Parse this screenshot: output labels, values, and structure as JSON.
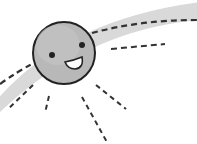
{
  "illustration": {
    "subject": "smiling sun on arc path with dashed rays",
    "colors": {
      "background": "#ffffff",
      "arc_band": "#d9d9d9",
      "sun_fill": "#b8b8b8",
      "sun_outline": "#222222",
      "dash": "#333333",
      "mouth_fill": "#ffffff"
    },
    "sun": {
      "cx": 64,
      "cy": 53,
      "r": 32
    },
    "icons": [
      "sun-face-icon"
    ]
  }
}
